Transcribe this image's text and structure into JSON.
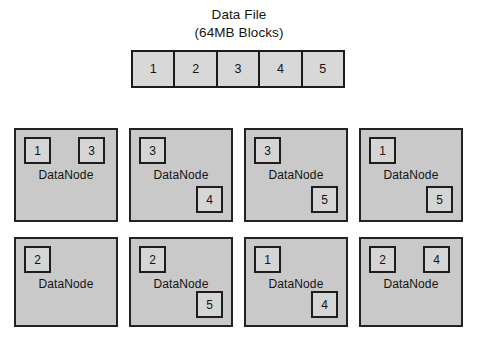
{
  "diagram": {
    "title_line_1": "Data File",
    "title_line_2": "(64MB Blocks)"
  },
  "file_strip": {
    "blocks": [
      {
        "label": "1"
      },
      {
        "label": "2"
      },
      {
        "label": "3"
      },
      {
        "label": "4"
      },
      {
        "label": "5"
      }
    ]
  },
  "datanodes": [
    {
      "label": "DataNode",
      "row": 1,
      "column": 1,
      "left": 14,
      "top": 128,
      "chips": [
        {
          "label": "1",
          "slot": "slot-tl"
        },
        {
          "label": "3",
          "slot": "slot-tr"
        }
      ]
    },
    {
      "label": "DataNode",
      "row": 1,
      "column": 2,
      "left": 129,
      "top": 128,
      "chips": [
        {
          "label": "3",
          "slot": "slot-tl"
        },
        {
          "label": "4",
          "slot": "slot-br"
        }
      ]
    },
    {
      "label": "DataNode",
      "row": 1,
      "column": 3,
      "left": 244,
      "top": 128,
      "chips": [
        {
          "label": "3",
          "slot": "slot-tl"
        },
        {
          "label": "5",
          "slot": "slot-br"
        }
      ]
    },
    {
      "label": "DataNode",
      "row": 1,
      "column": 4,
      "left": 359,
      "top": 128,
      "chips": [
        {
          "label": "1",
          "slot": "slot-tl"
        },
        {
          "label": "5",
          "slot": "slot-br"
        }
      ]
    },
    {
      "label": "DataNode",
      "row": 2,
      "column": 1,
      "left": 14,
      "top": 237,
      "chips": [
        {
          "label": "2",
          "slot": "slot-tl"
        }
      ]
    },
    {
      "label": "DataNode",
      "row": 2,
      "column": 2,
      "left": 129,
      "top": 237,
      "chips": [
        {
          "label": "2",
          "slot": "slot-tl"
        },
        {
          "label": "5",
          "slot": "slot-br"
        }
      ]
    },
    {
      "label": "DataNode",
      "row": 2,
      "column": 3,
      "left": 244,
      "top": 237,
      "chips": [
        {
          "label": "1",
          "slot": "slot-tl"
        },
        {
          "label": "4",
          "slot": "slot-br"
        }
      ]
    },
    {
      "label": "DataNode",
      "row": 2,
      "column": 4,
      "left": 359,
      "top": 237,
      "chips": [
        {
          "label": "2",
          "slot": "slot-tl"
        },
        {
          "label": "4",
          "slot": "slot-tr"
        }
      ]
    }
  ],
  "colors": {
    "panel_fill": "#c9c9c9",
    "panel_border": "#232323",
    "chip_fill": "#d5d5d5",
    "chip_border": "#1d1d1d",
    "strip_fill": "#d8d8d8",
    "strip_border": "#1b1b1b",
    "text": "#131313",
    "background": "#ffffff"
  }
}
